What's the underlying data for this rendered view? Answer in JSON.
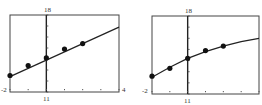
{
  "chart_data": [
    {
      "type": "scatter",
      "title": "",
      "xlabel": "",
      "ylabel": "",
      "xlim": [
        -2,
        4
      ],
      "ylim": [
        11,
        18
      ],
      "x_ticks_step": 1,
      "y_ticks_step": 1,
      "grid": false,
      "window_labels": {
        "xmin": "-2",
        "xmax": "4",
        "ymin": "11",
        "ymax": "18"
      },
      "points": {
        "x": [
          -2,
          -1,
          0,
          1,
          2
        ],
        "y": [
          12.5,
          13.4,
          14.1,
          14.9,
          15.4
        ]
      },
      "fit": {
        "type": "line",
        "x": [
          -2,
          4
        ],
        "y": [
          12.4,
          16.9
        ]
      }
    },
    {
      "type": "scatter",
      "title": "",
      "xlabel": "",
      "ylabel": "",
      "xlim": [
        -2,
        4
      ],
      "ylim": [
        11,
        18
      ],
      "x_ticks_step": 1,
      "y_ticks_step": 1,
      "grid": false,
      "window_labels": {
        "xmin": "-2",
        "xmax": "",
        "ymin": "11",
        "ymax": "18"
      },
      "points": {
        "x": [
          -2,
          -1,
          0,
          1,
          2
        ],
        "y": [
          12.6,
          13.3,
          14.2,
          14.9,
          15.3
        ]
      },
      "fit": {
        "type": "curve",
        "x": [
          -2,
          -1,
          0,
          1,
          2,
          3,
          4
        ],
        "y": [
          12.5,
          13.4,
          14.2,
          14.8,
          15.3,
          15.7,
          16.0
        ]
      }
    }
  ],
  "plots": [
    {
      "label_ymax": "18",
      "label_ymin": "11",
      "label_xmin": "-2",
      "label_xmax": "4"
    },
    {
      "label_ymax": "18",
      "label_ymin": "11",
      "label_xmin": "-2",
      "label_xmax": ""
    }
  ]
}
